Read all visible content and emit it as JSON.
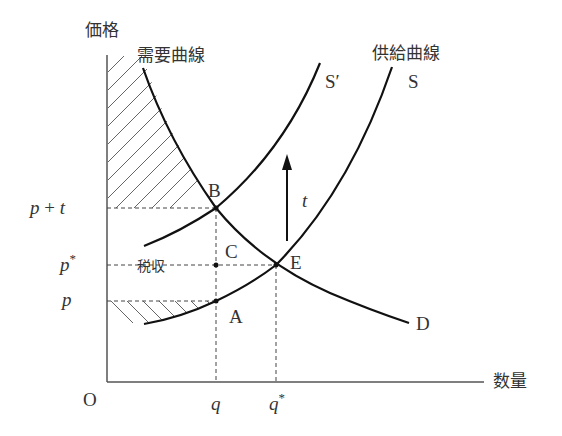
{
  "axes": {
    "y_label": "価格",
    "x_label": "数量",
    "origin_label": "O"
  },
  "curves": {
    "demand_title": "需要曲線",
    "demand_label": "D",
    "supply_title": "供給曲線",
    "supply_label": "S",
    "shifted_supply_label": "S′"
  },
  "points": {
    "b": "B",
    "c": "C",
    "e": "E",
    "a": "A"
  },
  "price_ticks": {
    "p_plus_t_p": "p",
    "p_plus_t_op": " + ",
    "p_plus_t_t": "t",
    "p_star": "p",
    "p_star_sup": "*",
    "p": "p"
  },
  "quantity_ticks": {
    "q": "q",
    "q_star": "q",
    "q_star_sup": "*"
  },
  "annotations": {
    "tax_revenue": "税収",
    "tax_arrow_label": "t"
  },
  "colors": {
    "curve": "#111111",
    "axis": "#555555",
    "text": "#333333",
    "hatch": "#666666"
  }
}
